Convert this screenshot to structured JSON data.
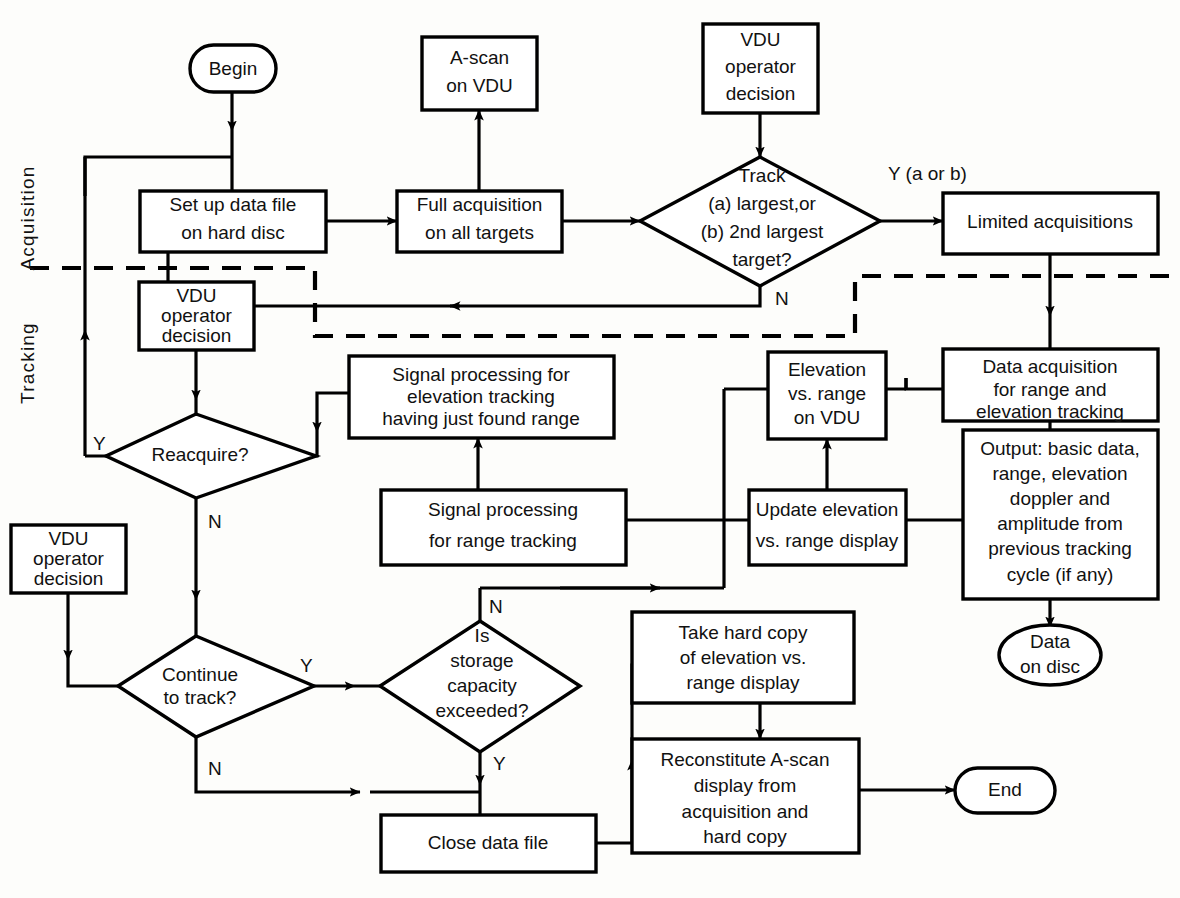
{
  "diagram": {
    "sections": [
      {
        "id": "acquisition",
        "label": "Acquisition"
      },
      {
        "id": "tracking",
        "label": "Tracking"
      }
    ],
    "nodes": [
      {
        "id": "begin",
        "shape": "terminator",
        "lines": [
          "Begin"
        ]
      },
      {
        "id": "setup-data-file",
        "shape": "process",
        "lines": [
          "Set up data file",
          "on hard disc"
        ]
      },
      {
        "id": "a-scan-vdu",
        "shape": "process",
        "lines": [
          "A-scan",
          "on VDU"
        ]
      },
      {
        "id": "full-acquisition",
        "shape": "process",
        "lines": [
          "Full acquisition",
          "on all targets"
        ]
      },
      {
        "id": "vdu-decision-1",
        "shape": "process",
        "lines": [
          "VDU",
          "operator",
          "decision"
        ]
      },
      {
        "id": "track-decision",
        "shape": "decision",
        "lines": [
          "Track",
          "(a) largest,or",
          "(b) 2nd largest",
          "target?"
        ]
      },
      {
        "id": "limited-acq",
        "shape": "process",
        "lines": [
          "Limited acquisitions"
        ]
      },
      {
        "id": "data-acquisition",
        "shape": "process",
        "lines": [
          "Data acquisition",
          "for range and",
          "elevation tracking"
        ]
      },
      {
        "id": "vdu-decision-2",
        "shape": "process",
        "lines": [
          "VDU",
          "operator",
          "decision"
        ]
      },
      {
        "id": "reacquire",
        "shape": "decision",
        "lines": [
          "Reacquire?"
        ]
      },
      {
        "id": "sig-proc-elev",
        "shape": "process",
        "lines": [
          "Signal processing for",
          "elevation tracking",
          "having just found range"
        ]
      },
      {
        "id": "sig-proc-range",
        "shape": "process",
        "lines": [
          "Signal processing",
          "for range tracking"
        ]
      },
      {
        "id": "elev-vs-range-vdu",
        "shape": "process",
        "lines": [
          "Elevation",
          "vs. range",
          "on VDU"
        ]
      },
      {
        "id": "update-elev",
        "shape": "process",
        "lines": [
          "Update elevation",
          "vs. range display"
        ]
      },
      {
        "id": "output-basic",
        "shape": "process",
        "lines": [
          "Output: basic data,",
          "range, elevation",
          "doppler and",
          "amplitude from",
          "previous tracking",
          "cycle (if any)"
        ]
      },
      {
        "id": "data-on-disc",
        "shape": "terminator",
        "lines": [
          "Data",
          "on disc"
        ]
      },
      {
        "id": "vdu-decision-3",
        "shape": "process",
        "lines": [
          "VDU",
          "operator",
          "decision"
        ]
      },
      {
        "id": "continue-track",
        "shape": "decision",
        "lines": [
          "Continue",
          "to track?"
        ]
      },
      {
        "id": "storage-capacity",
        "shape": "decision",
        "lines": [
          "Is",
          "storage",
          "capacity",
          "exceeded?"
        ]
      },
      {
        "id": "take-hard-copy",
        "shape": "process",
        "lines": [
          "Take hard copy",
          "of elevation vs.",
          "range display"
        ]
      },
      {
        "id": "reconstitute",
        "shape": "process",
        "lines": [
          "Reconstitute A-scan",
          "display from",
          "acquisition and",
          "hard copy"
        ]
      },
      {
        "id": "close-data-file",
        "shape": "process",
        "lines": [
          "Close data file"
        ]
      },
      {
        "id": "end",
        "shape": "terminator",
        "lines": [
          "End"
        ]
      }
    ],
    "edge_labels": [
      {
        "id": "track-yes",
        "text": "Y (a or b)"
      },
      {
        "id": "track-no",
        "text": "N"
      },
      {
        "id": "reacquire-yes",
        "text": "Y"
      },
      {
        "id": "reacquire-no",
        "text": "N"
      },
      {
        "id": "continue-yes",
        "text": "Y"
      },
      {
        "id": "continue-no",
        "text": "N"
      },
      {
        "id": "storage-no",
        "text": "N"
      },
      {
        "id": "storage-yes",
        "text": "Y"
      }
    ],
    "colors": {
      "line": "#000000",
      "fill": "#ffffff",
      "background": "#fdfdfb"
    }
  }
}
